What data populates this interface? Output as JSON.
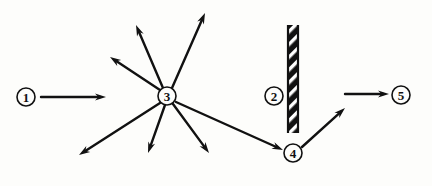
{
  "figure": {
    "kind": "physics-ray-diagram",
    "background_color": "#fdfdfb",
    "ink_color": "#111111",
    "width": 432,
    "height": 186
  },
  "nodes": [
    {
      "id": "n1",
      "label": "1",
      "cx": 26,
      "cy": 97,
      "r": 9
    },
    {
      "id": "n2",
      "label": "2",
      "cx": 274,
      "cy": 96,
      "r": 9
    },
    {
      "id": "n3",
      "label": "3",
      "cx": 167,
      "cy": 96,
      "r": 9
    },
    {
      "id": "n4",
      "label": "4",
      "cx": 293,
      "cy": 153,
      "r": 9
    },
    {
      "id": "n5",
      "label": "5",
      "cx": 401,
      "cy": 95,
      "r": 9
    }
  ],
  "barrier": {
    "id": "b1",
    "name": "hatched-barrier",
    "x": 288,
    "y": 25,
    "width": 10,
    "height": 108,
    "hatch_angle_deg": 45,
    "fill_color": "#111111",
    "hatch_color": "#ffffff"
  },
  "arrows": [
    {
      "id": "a1",
      "name": "incoming-ray-1-to-3",
      "x1": 41,
      "y1": 97,
      "x2": 106,
      "y2": 97
    },
    {
      "id": "a2",
      "name": "scattered-ray-upper-left",
      "x1": 160,
      "y1": 90,
      "x2": 110,
      "y2": 57
    },
    {
      "id": "a3",
      "name": "scattered-ray-up-left-steep",
      "x1": 163,
      "y1": 88,
      "x2": 136,
      "y2": 25
    },
    {
      "id": "a4",
      "name": "scattered-ray-up-right",
      "x1": 172,
      "y1": 88,
      "x2": 205,
      "y2": 13
    },
    {
      "id": "a5",
      "name": "scattered-ray-lower-left",
      "x1": 160,
      "y1": 103,
      "x2": 79,
      "y2": 155
    },
    {
      "id": "a6",
      "name": "scattered-ray-down-steep",
      "x1": 165,
      "y1": 105,
      "x2": 148,
      "y2": 153
    },
    {
      "id": "a7",
      "name": "scattered-ray-down-right",
      "x1": 173,
      "y1": 104,
      "x2": 209,
      "y2": 153
    },
    {
      "id": "a8",
      "name": "scattered-ray-3-to-4",
      "x1": 176,
      "y1": 102,
      "x2": 283,
      "y2": 150
    },
    {
      "id": "a9",
      "name": "reflected-ray-4-upward",
      "x1": 302,
      "y1": 147,
      "x2": 345,
      "y2": 108
    },
    {
      "id": "a10",
      "name": "outgoing-ray-to-5",
      "x1": 345,
      "y1": 94,
      "x2": 389,
      "y2": 94
    }
  ],
  "stroke": {
    "ray_width": 2.4,
    "circle_width": 1.6,
    "arrowhead_length": 11,
    "arrowhead_half_width": 3.6
  }
}
